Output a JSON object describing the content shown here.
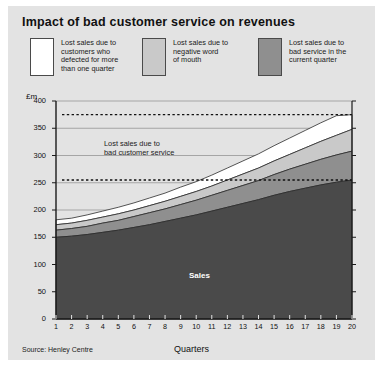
{
  "title": "Impact of bad customer service on revenues",
  "source": "Source: Henley Centre",
  "colors": {
    "panel_bg": "#e3e3e3",
    "defected": "#ffffff",
    "negative_word": "#c9c9c9",
    "bad_service": "#8f8f8f",
    "sales": "#4a4a4a",
    "axis": "#1a1a1a",
    "grid": "#8a8a8a"
  },
  "legend": {
    "items": [
      {
        "label": "Lost sales due to\ncustomers who\ndefected for more\nthan one quarter",
        "color": "#ffffff",
        "key": "defected"
      },
      {
        "label": "Lost sales due to\nnegative word\nof mouth",
        "color": "#c9c9c9",
        "key": "negative_word"
      },
      {
        "label": "Lost sales due to\nbad service in the\ncurrent quarter",
        "color": "#8f8f8f",
        "key": "bad_service"
      }
    ]
  },
  "annotations": {
    "inplot_note": "Lost sales due to\nbad customer service",
    "sales_label": "Sales"
  },
  "chart_data": {
    "type": "area",
    "title": "Impact of bad customer service on revenues",
    "xlabel": "Quarters",
    "ylabel": "£m",
    "ylim": [
      0,
      400
    ],
    "xlim": [
      1,
      20
    ],
    "yticks": [
      0,
      50,
      100,
      150,
      200,
      250,
      300,
      350,
      400
    ],
    "xticks": [
      1,
      2,
      3,
      4,
      5,
      6,
      7,
      8,
      9,
      10,
      11,
      12,
      13,
      14,
      15,
      16,
      17,
      18,
      19,
      20
    ],
    "grid": true,
    "legend_position": "top",
    "stacked": true,
    "x": [
      1,
      2,
      3,
      4,
      5,
      6,
      7,
      8,
      9,
      10,
      11,
      12,
      13,
      14,
      15,
      16,
      17,
      18,
      19,
      20
    ],
    "series": [
      {
        "name": "Sales",
        "key": "sales",
        "color": "#4a4a4a",
        "values": [
          150,
          152,
          155,
          159,
          163,
          168,
          173,
          179,
          185,
          191,
          198,
          205,
          212,
          219,
          227,
          234,
          240,
          246,
          251,
          255
        ]
      },
      {
        "name": "Lost sales due to bad service in the current quarter",
        "key": "bad_service",
        "color": "#8f8f8f",
        "values": [
          13,
          14,
          15,
          17,
          18,
          20,
          22,
          23,
          25,
          27,
          29,
          31,
          33,
          35,
          38,
          41,
          44,
          47,
          50,
          53
        ]
      },
      {
        "name": "Lost sales due to negative word of mouth",
        "key": "negative_word",
        "color": "#c9c9c9",
        "values": [
          10,
          10,
          11,
          11,
          12,
          12,
          13,
          14,
          15,
          16,
          17,
          19,
          21,
          23,
          25,
          27,
          30,
          33,
          36,
          40
        ]
      },
      {
        "name": "Lost sales due to customers who defected for more than one quarter",
        "key": "defected",
        "color": "#ffffff",
        "values": [
          9,
          9,
          10,
          11,
          12,
          13,
          14,
          15,
          17,
          18,
          20,
          22,
          24,
          26,
          28,
          30,
          32,
          34,
          36,
          27
        ]
      }
    ],
    "cumulative_totals": [
      182,
      185,
      191,
      198,
      205,
      213,
      222,
      231,
      242,
      252,
      264,
      277,
      290,
      303,
      318,
      332,
      346,
      360,
      373,
      375
    ],
    "reference_lines": [
      {
        "value": 375,
        "style": "dashed",
        "label": ""
      },
      {
        "value": 255,
        "style": "dashed",
        "label": ""
      }
    ]
  }
}
